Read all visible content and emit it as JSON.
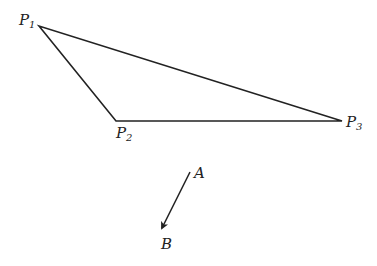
{
  "diagram": {
    "points": [
      {
        "id": "P1",
        "label": "P",
        "subscript": "1",
        "x": 39,
        "y": 26
      },
      {
        "id": "P2",
        "label": "P",
        "subscript": "2",
        "x": 116,
        "y": 121
      },
      {
        "id": "P3",
        "label": "P",
        "subscript": "3",
        "x": 342,
        "y": 121
      }
    ],
    "edges": [
      [
        "P1",
        "P2"
      ],
      [
        "P2",
        "P3"
      ],
      [
        "P3",
        "P1"
      ]
    ],
    "vector": {
      "start_label": "A",
      "end_label": "B",
      "start": {
        "x": 190,
        "y": 172
      },
      "end": {
        "x": 161,
        "y": 230
      }
    },
    "colors": {
      "stroke": "#222222",
      "background": "#ffffff"
    }
  }
}
